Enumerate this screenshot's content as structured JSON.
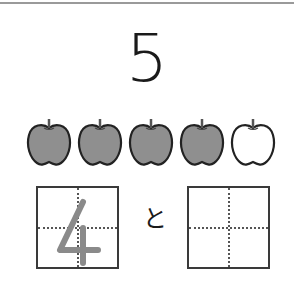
{
  "worksheet": {
    "target_number": "5",
    "apples": [
      {
        "filled": true
      },
      {
        "filled": true
      },
      {
        "filled": true
      },
      {
        "filled": true
      },
      {
        "filled": false
      }
    ],
    "apple_fill_color": "#8f8f8f",
    "apple_outline_color": "#222222",
    "left_box": {
      "value": "4",
      "trace_color": "#8a8a8a"
    },
    "connector": "と",
    "right_box": {
      "value": ""
    }
  }
}
